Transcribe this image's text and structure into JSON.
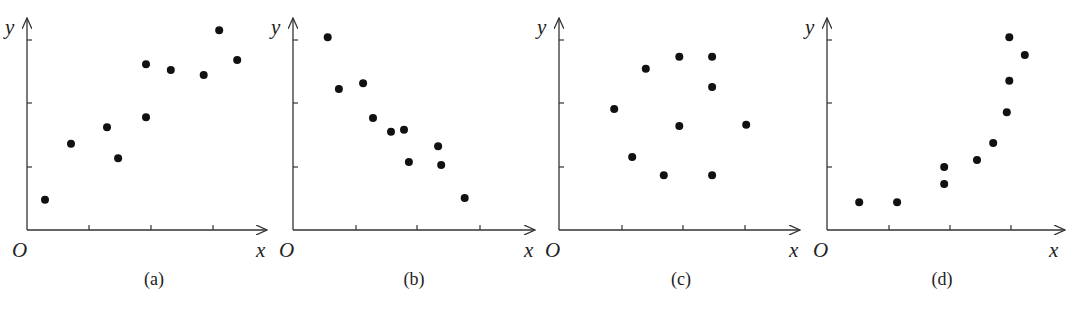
{
  "figure": {
    "panels": [
      {
        "id": "a",
        "caption": "(a)",
        "origin_label": "O",
        "x_label": "x",
        "y_label": "y"
      },
      {
        "id": "b",
        "caption": "(b)",
        "origin_label": "O",
        "x_label": "x",
        "y_label": "y"
      },
      {
        "id": "c",
        "caption": "(c)",
        "origin_label": "O",
        "x_label": "x",
        "y_label": "y"
      },
      {
        "id": "d",
        "caption": "(d)",
        "origin_label": "O",
        "x_label": "x",
        "y_label": "y"
      }
    ]
  },
  "colors": {
    "dot": "#111111",
    "axis": "#333333",
    "background": "#ffffff"
  },
  "chart_data": [
    {
      "type": "scatter",
      "title": "(a)",
      "xlabel": "x",
      "ylabel": "y",
      "xlim": [
        0,
        4
      ],
      "ylim": [
        0,
        3.2
      ],
      "grid": false,
      "trend": "positive linear correlation",
      "x": [
        0.29,
        0.71,
        1.29,
        1.47,
        1.92,
        1.92,
        2.32,
        2.85,
        3.1,
        3.39
      ],
      "y": [
        0.48,
        1.37,
        1.63,
        1.14,
        1.79,
        2.63,
        2.54,
        2.46,
        3.17,
        2.7
      ]
    },
    {
      "type": "scatter",
      "title": "(b)",
      "xlabel": "x",
      "ylabel": "y",
      "xlim": [
        0,
        4
      ],
      "ylim": [
        0,
        3.2
      ],
      "grid": false,
      "trend": "negative linear correlation",
      "x": [
        0.56,
        0.74,
        1.13,
        1.29,
        1.58,
        1.79,
        1.87,
        2.34,
        2.39,
        2.77
      ],
      "y": [
        3.06,
        2.24,
        2.33,
        1.78,
        1.56,
        1.59,
        1.08,
        1.33,
        1.03,
        0.51
      ]
    },
    {
      "type": "scatter",
      "title": "(c)",
      "xlabel": "x",
      "ylabel": "y",
      "xlim": [
        0,
        4
      ],
      "ylim": [
        0,
        3.2
      ],
      "grid": false,
      "trend": "no correlation",
      "x": [
        0.89,
        1.18,
        1.4,
        1.69,
        1.94,
        1.94,
        2.47,
        2.47,
        2.47,
        3.02
      ],
      "y": [
        1.92,
        1.16,
        2.56,
        0.87,
        2.75,
        1.65,
        2.75,
        2.27,
        0.87,
        1.67
      ]
    },
    {
      "type": "scatter",
      "title": "(d)",
      "xlabel": "x",
      "ylabel": "y",
      "xlim": [
        0,
        4
      ],
      "ylim": [
        0,
        3.2
      ],
      "grid": false,
      "trend": "nonlinear (curved) correlation",
      "x": [
        0.52,
        1.13,
        1.89,
        1.89,
        2.42,
        2.68,
        2.9,
        2.94,
        2.94,
        3.19
      ],
      "y": [
        0.44,
        0.44,
        1.0,
        0.73,
        1.11,
        1.38,
        1.87,
        2.37,
        3.06,
        2.78
      ]
    }
  ]
}
